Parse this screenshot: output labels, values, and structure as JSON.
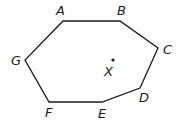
{
  "diagram": {
    "type": "polygon",
    "stroke_color": "#1a1a1a",
    "vertices": [
      {
        "label": "A",
        "x": 63,
        "y": 21,
        "label_x": 56,
        "label_y": 15
      },
      {
        "label": "B",
        "x": 120,
        "y": 21,
        "label_x": 117,
        "label_y": 15
      },
      {
        "label": "C",
        "x": 158,
        "y": 48,
        "label_x": 163,
        "label_y": 54
      },
      {
        "label": "D",
        "x": 140,
        "y": 88,
        "label_x": 139,
        "label_y": 102
      },
      {
        "label": "E",
        "x": 102,
        "y": 102,
        "label_x": 98,
        "label_y": 118
      },
      {
        "label": "F",
        "x": 49,
        "y": 102,
        "label_x": 45,
        "label_y": 117
      },
      {
        "label": "G",
        "x": 25,
        "y": 60,
        "label_x": 11,
        "label_y": 65
      }
    ],
    "point": {
      "label": "X",
      "x": 113,
      "y": 60,
      "label_x": 104,
      "label_y": 76
    }
  }
}
